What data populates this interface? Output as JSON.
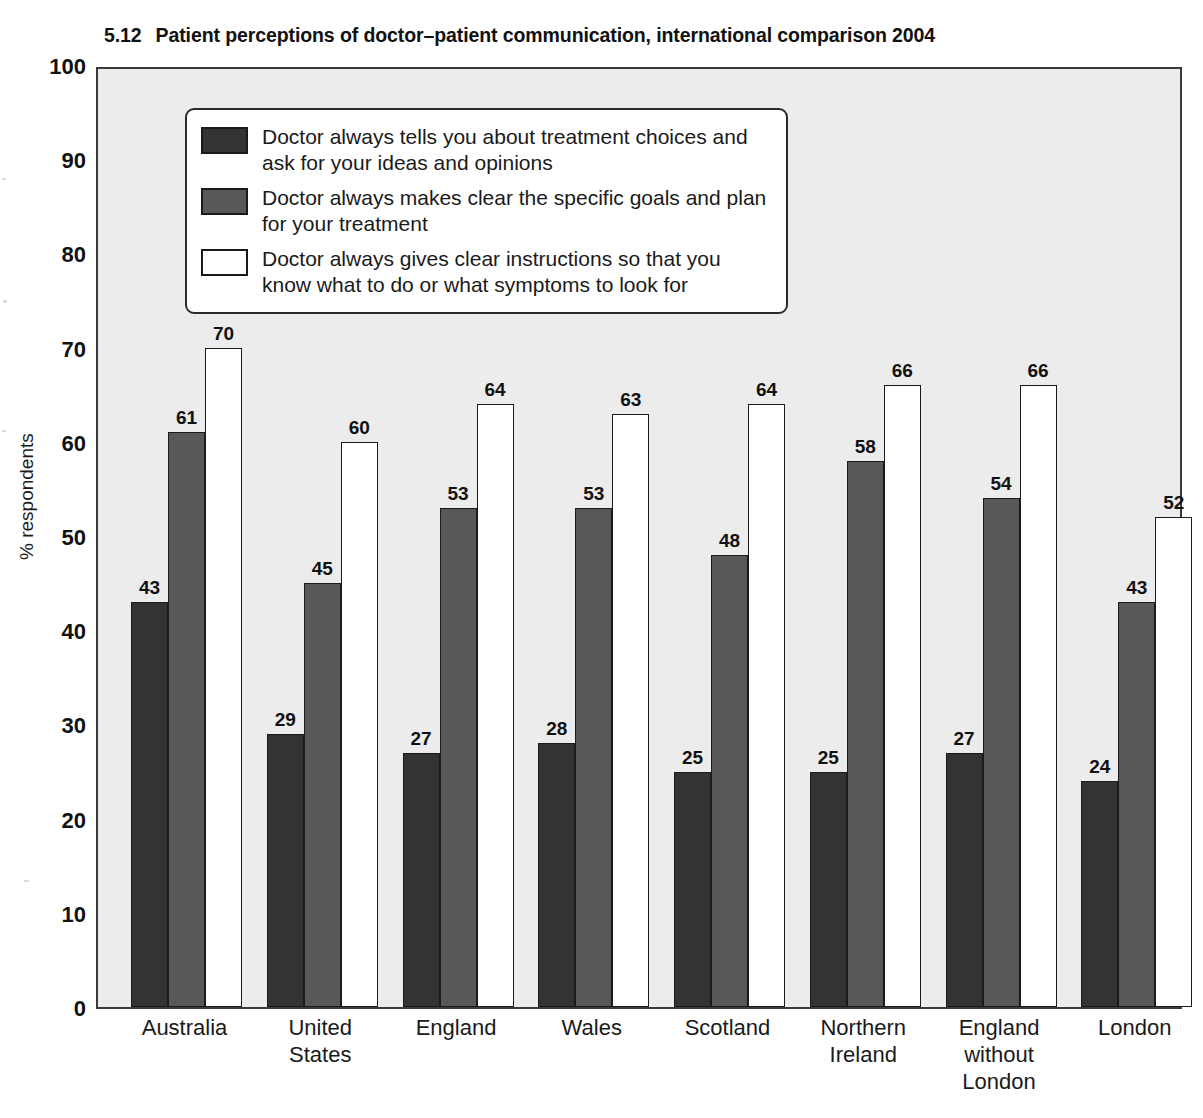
{
  "title": {
    "number": "5.12",
    "text": "Patient perceptions of doctor–patient communication, international comparison 2004"
  },
  "chart_data": {
    "type": "bar",
    "title": "Patient perceptions of doctor–patient communication, international comparison 2004",
    "xlabel": "",
    "ylabel": "% respondents",
    "ylim": [
      0,
      100
    ],
    "yticks": [
      0,
      10,
      20,
      30,
      40,
      50,
      60,
      70,
      80,
      90,
      100
    ],
    "grid": false,
    "legend_position": "upper-left-inside",
    "categories": [
      "Australia",
      "United\nStates",
      "England",
      "Wales",
      "Scotland",
      "Northern\nIreland",
      "England\nwithout\nLondon",
      "London"
    ],
    "series": [
      {
        "name": "Doctor always tells you about treatment choices and ask for your ideas and opinions",
        "color": "#333333",
        "values": [
          43,
          29,
          27,
          28,
          25,
          25,
          27,
          24
        ]
      },
      {
        "name": "Doctor always makes clear the specific goals and plan for your treatment",
        "color": "#585858",
        "values": [
          61,
          45,
          53,
          53,
          48,
          58,
          54,
          43
        ]
      },
      {
        "name": "Doctor always gives clear instructions so that you know what to do or what symptoms to look for",
        "color": "#ffffff",
        "values": [
          70,
          60,
          64,
          63,
          64,
          66,
          66,
          52
        ]
      }
    ]
  }
}
